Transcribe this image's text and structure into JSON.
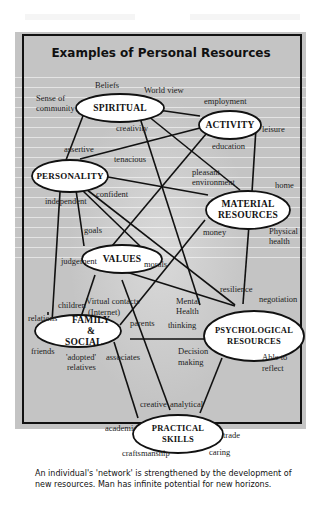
{
  "title": "Examples of Personal Resources",
  "nodes": {
    "spiritual": "SPIRITUAL",
    "activity": "ACTIVITY",
    "personality": "PERSONALITY",
    "material_line1": "MATERIAL",
    "material_line2": "RESOURCES",
    "values": "VALUES",
    "family_line1": "FAMILY &",
    "family_line2": "SOCIAL",
    "psychological_line1": "PSYCHOLOGICAL",
    "psychological_line2": "RESOURCES",
    "practical_line1": "PRACTICAL",
    "practical_line2": "SKILLS"
  },
  "labels": {
    "beliefs": "Beliefs",
    "world_view": "World view",
    "sense_of": "Sense of",
    "community": "community",
    "employment": "employment",
    "creativity": "creativity",
    "leisure": "leisure",
    "assertive": "assertive",
    "education": "education",
    "tenacious": "tenacious",
    "pleasant": "pleasant",
    "environment": "environment",
    "home": "home",
    "confident": "confident",
    "independent": "independent",
    "goals": "goals",
    "money": "money",
    "physical": "Physical",
    "health": "health",
    "judgement": "judgement",
    "morals": "morals",
    "resilience": "resilience",
    "negotiation": "negotiation",
    "children": "children",
    "virtual_contacts": "Virtual contacts",
    "internet": "(Internet)",
    "mental": "Mental",
    "mental_health": "Health",
    "relations": "relations",
    "parents": "parents",
    "thinking": "thinking",
    "friends": "friends",
    "adopted": "'adopted'",
    "associates": "associates",
    "relatives": "relatives",
    "decision": "Decision",
    "making": "making",
    "able_to": "Able to",
    "reflect": "reflect",
    "creative": "creative",
    "analytical": "analytical",
    "academic": "academic",
    "trade": "trade",
    "craftsmanship": "craftsmanship",
    "caring": "caring"
  },
  "caption": "An individual's 'network' is strengthened by the development of new resources. Man has infinite potential for new horizons.",
  "colors": {
    "panel": "#c4c4c4",
    "line": "#111111",
    "node_fill": "#ffffff"
  }
}
